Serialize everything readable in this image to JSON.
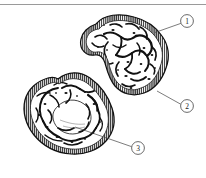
{
  "figure": {
    "type": "scientific-line-illustration",
    "style": "black-and-white engraved cross-section",
    "background_color": "#ffffff",
    "ink_color": "#111111",
    "top_rule_color": "#9a9a9a",
    "specimens": [
      {
        "id": "upper-section",
        "name": "upper-cross-section",
        "shape": "bilobed kidney-bean with medial notch",
        "has_striated_rim": true,
        "interior": "branching dark trabecular network on white ground"
      },
      {
        "id": "lower-section",
        "name": "lower-cross-section",
        "shape": "rounded pentagonal",
        "has_striated_rim": true,
        "interior": "dense trabecular network surrounding a pale central zone"
      }
    ],
    "callouts": [
      {
        "number": "1",
        "name": "callout-1",
        "target": "upper-section outer rim, upper right margin",
        "circle": {
          "cx": 187,
          "cy": 21,
          "r": 6.4
        },
        "leader": {
          "x1": 180.8,
          "y1": 23.4,
          "x2": 155.0,
          "y2": 32.5
        }
      },
      {
        "number": "2",
        "name": "callout-2",
        "target": "upper-section striated capsule, lower right margin",
        "circle": {
          "cx": 187,
          "cy": 106,
          "r": 6.4
        },
        "leader": {
          "x1": 180.7,
          "y1": 104.2,
          "x2": 157.0,
          "y2": 91.0
        }
      },
      {
        "number": "3",
        "name": "callout-3",
        "target": "lower-section pale central zone",
        "circle": {
          "cx": 138,
          "cy": 148,
          "r": 6.4
        },
        "leader": {
          "x1": 131.7,
          "y1": 146.7,
          "x2": 75.0,
          "y2": 127.0
        }
      }
    ]
  }
}
